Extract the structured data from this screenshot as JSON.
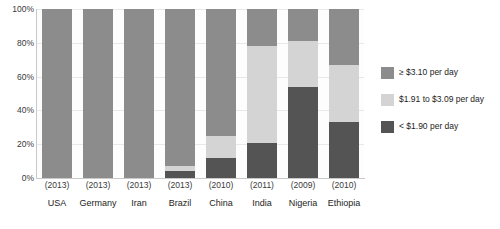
{
  "chart_data": {
    "type": "bar",
    "subtype": "stacked-bar-100-percent",
    "title": "",
    "xlabel": "",
    "ylabel": "",
    "ylim": [
      0,
      100
    ],
    "yticks": [
      "0%",
      "20%",
      "40%",
      "60%",
      "80%",
      "100%"
    ],
    "ytick_values": [
      0,
      20,
      40,
      60,
      80,
      100
    ],
    "grid": true,
    "legend_position": "right",
    "categories": [
      "USA",
      "Germany",
      "Iran",
      "Brazil",
      "China",
      "India",
      "Nigeria",
      "Ethiopia"
    ],
    "category_years": [
      "(2013)",
      "(2013)",
      "(2013)",
      "(2013)",
      "(2010)",
      "(2011)",
      "(2009)",
      "(2010)"
    ],
    "series": [
      {
        "name": "< $1.90 per day",
        "color": "#545454",
        "values": [
          0,
          0,
          0,
          4,
          12,
          21,
          54,
          33
        ]
      },
      {
        "name": "$1.91 to $3.09 per day",
        "color": "#d4d4d4",
        "values": [
          0,
          0,
          0,
          3,
          13,
          57,
          27,
          34
        ]
      },
      {
        "name": "≥ $3.10 per day",
        "color": "#8c8c8c",
        "values": [
          100,
          100,
          100,
          93,
          75,
          22,
          19,
          33
        ]
      }
    ],
    "legend": [
      {
        "label": "≥ $3.10 per day",
        "color": "#8c8c8c"
      },
      {
        "label": "$1.91 to $3.09 per day",
        "color": "#d4d4d4"
      },
      {
        "label": "< $1.90 per day",
        "color": "#545454"
      }
    ]
  }
}
